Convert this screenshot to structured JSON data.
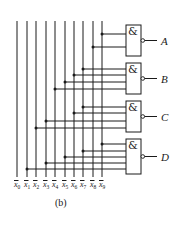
{
  "diagram": {
    "type": "logic-circuit",
    "caption": "(b)",
    "gate_symbol": "&",
    "inputs": [
      {
        "id": "x0",
        "label": "x",
        "sub": "0",
        "negated": true,
        "x": 17
      },
      {
        "id": "x1",
        "label": "x",
        "sub": "1",
        "negated": true,
        "x": 27
      },
      {
        "id": "x2",
        "label": "x",
        "sub": "2",
        "negated": true,
        "x": 36
      },
      {
        "id": "x3",
        "label": "x",
        "sub": "3",
        "negated": true,
        "x": 46
      },
      {
        "id": "x4",
        "label": "x",
        "sub": "4",
        "negated": true,
        "x": 55
      },
      {
        "id": "x5",
        "label": "x",
        "sub": "5",
        "negated": true,
        "x": 65
      },
      {
        "id": "x6",
        "label": "x",
        "sub": "6",
        "negated": true,
        "x": 74
      },
      {
        "id": "x7",
        "label": "x",
        "sub": "7",
        "negated": true,
        "x": 83
      },
      {
        "id": "x8",
        "label": "x",
        "sub": "8",
        "negated": true,
        "x": 93
      },
      {
        "id": "x9",
        "label": "x",
        "sub": "9",
        "negated": true,
        "x": 102
      }
    ],
    "gates": [
      {
        "output": "A",
        "type": "NAND",
        "top": 25,
        "bottom": 56,
        "connections": [
          {
            "input": "x9",
            "y": 34
          },
          {
            "input": "x8",
            "y": 47
          }
        ]
      },
      {
        "output": "B",
        "type": "NAND",
        "top": 63,
        "bottom": 94,
        "connections": [
          {
            "input": "x7",
            "y": 69
          },
          {
            "input": "x6",
            "y": 75
          },
          {
            "input": "x5",
            "y": 82
          },
          {
            "input": "x4",
            "y": 89
          }
        ]
      },
      {
        "output": "C",
        "type": "NAND",
        "top": 101,
        "bottom": 132,
        "connections": [
          {
            "input": "x7",
            "y": 107
          },
          {
            "input": "x6",
            "y": 113
          },
          {
            "input": "x3",
            "y": 121
          },
          {
            "input": "x2",
            "y": 128
          }
        ]
      },
      {
        "output": "D",
        "type": "NAND",
        "top": 139,
        "bottom": 174,
        "connections": [
          {
            "input": "x9",
            "y": 144
          },
          {
            "input": "x7",
            "y": 151
          },
          {
            "input": "x5",
            "y": 157
          },
          {
            "input": "x3",
            "y": 163
          },
          {
            "input": "x1",
            "y": 169
          }
        ]
      }
    ]
  }
}
